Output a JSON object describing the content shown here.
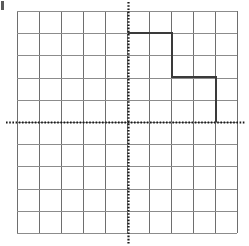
{
  "figure": {
    "kind": "cartesian-coordinate-grid-with-polyline",
    "width": 249,
    "height": 246,
    "background_color": "#ffffff",
    "corner_mark": {
      "name": "crop-edge-artifact",
      "color": "#5a5a5a"
    }
  },
  "grid": {
    "columns": 10,
    "rows": 10,
    "cell_size_px": 22,
    "left_px": 17,
    "top_px": 11,
    "right_px": 237,
    "bottom_px": 233,
    "line_color": "#8c8c8c",
    "line_width_px": 1,
    "vertical_line_color": "#6e6e6e"
  },
  "axes": {
    "origin_px": {
      "x": 128,
      "y": 122
    },
    "x_axis": {
      "label": "",
      "orientation": "horizontal",
      "style": "dotted",
      "color": "#1a1a1a",
      "y_px": 122,
      "start_px": 6,
      "end_px": 245,
      "range": [
        -5,
        5
      ],
      "ticks": [
        -5,
        -4,
        -3,
        -2,
        -1,
        0,
        1,
        2,
        3,
        4,
        5
      ],
      "tick_labels": []
    },
    "y_axis": {
      "label": "",
      "orientation": "vertical",
      "style": "dotted",
      "color": "#1a1a1a",
      "x_px": 128,
      "start_px": 2,
      "end_px": 244,
      "range": [
        -5,
        5
      ],
      "ticks": [
        -5,
        -4,
        -3,
        -2,
        -1,
        0,
        1,
        2,
        3,
        4,
        5
      ],
      "tick_labels": []
    }
  },
  "chart_data": {
    "type": "line",
    "title": "",
    "xlabel": "",
    "ylabel": "",
    "xlim": [
      -5,
      5
    ],
    "ylim": [
      -5,
      5
    ],
    "grid": true,
    "legend": "none",
    "series": [
      {
        "name": "staircase-path",
        "shape": "descending-step-polyline",
        "color": "#3a3a3a",
        "line_width_px": 2,
        "closed": false,
        "points_graph": [
          [
            0,
            4
          ],
          [
            2,
            4
          ],
          [
            2,
            2
          ],
          [
            4,
            2
          ],
          [
            4,
            0
          ]
        ],
        "points_px": [
          [
            128,
            33
          ],
          [
            172,
            33
          ],
          [
            172,
            77
          ],
          [
            216,
            77
          ],
          [
            216,
            122
          ]
        ],
        "segments": [
          {
            "name": "top-horizontal",
            "from_graph": [
              0,
              4
            ],
            "to_graph": [
              2,
              4
            ],
            "length_units": 2
          },
          {
            "name": "first-drop",
            "from_graph": [
              2,
              4
            ],
            "to_graph": [
              2,
              2
            ],
            "length_units": 2
          },
          {
            "name": "middle-horizontal",
            "from_graph": [
              2,
              2
            ],
            "to_graph": [
              4,
              2
            ],
            "length_units": 2
          },
          {
            "name": "second-drop",
            "from_graph": [
              4,
              2
            ],
            "to_graph": [
              4,
              0
            ],
            "length_units": 2
          }
        ]
      }
    ]
  }
}
